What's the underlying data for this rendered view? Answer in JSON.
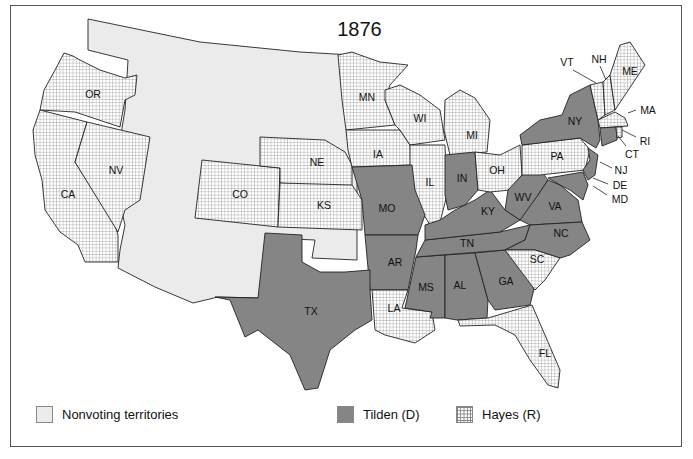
{
  "map": {
    "title": "1876",
    "colors": {
      "nonvoting": "#ebebeb",
      "tilden": "#858585",
      "hayes_bg": "#ffffff",
      "hayes_grid": "#7a7a7a",
      "border": "#222222"
    },
    "legend": [
      {
        "key": "nonvoting",
        "label": "Nonvoting territories"
      },
      {
        "key": "tilden",
        "label": "Tilden (D)"
      },
      {
        "key": "hayes",
        "label": "Hayes (R)"
      }
    ],
    "states": {
      "tilden": [
        "TX",
        "MO",
        "AR",
        "LA_none",
        "MS",
        "AL",
        "GA",
        "TN",
        "KY",
        "IN",
        "WV",
        "VA",
        "NC",
        "NY",
        "NJ",
        "CT",
        "DE",
        "MD"
      ],
      "hayes": [
        "OR",
        "CA",
        "NV",
        "CO",
        "NE",
        "KS",
        "MN",
        "IA",
        "WI",
        "IL",
        "MI",
        "OH",
        "PA",
        "VT",
        "NH",
        "ME",
        "MA",
        "RI",
        "SC",
        "LA",
        "FL"
      ]
    },
    "labels": {
      "OR": "OR",
      "CA": "CA",
      "NV": "NV",
      "CO": "CO",
      "NE": "NE",
      "KS": "KS",
      "TX": "TX",
      "MN": "MN",
      "IA": "IA",
      "MO": "MO",
      "AR": "AR",
      "LA": "LA",
      "WI": "WI",
      "IL": "IL",
      "MS": "MS",
      "MI": "MI",
      "IN": "IN",
      "KY": "KY",
      "TN": "TN",
      "AL": "AL",
      "GA": "GA",
      "FL": "FL",
      "SC": "SC",
      "NC": "NC",
      "VA": "VA",
      "WV": "WV",
      "OH": "OH",
      "PA": "PA",
      "NY": "NY",
      "VT": "VT",
      "NH": "NH",
      "ME": "ME",
      "MA": "MA",
      "RI": "RI",
      "CT": "CT",
      "NJ": "NJ",
      "DE": "DE",
      "MD": "MD"
    }
  }
}
